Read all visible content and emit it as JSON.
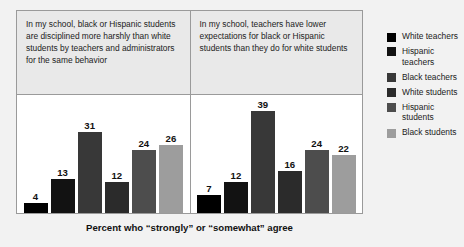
{
  "chart_data": {
    "type": "bar",
    "title": "",
    "xlabel": "Percent who “strongly” or “somewhat” agree",
    "ylabel": "",
    "ylim": [
      0,
      45
    ],
    "grid": false,
    "legend_position": "right",
    "categories": [
      "White teachers",
      "Hispanic teachers",
      "Black teachers",
      "White students",
      "Hispanic students",
      "Black students"
    ],
    "panels": [
      {
        "header": "In my school, black or Hispanic students are disciplined more harshly than white students by teachers and administrators for the same behavior",
        "values": [
          4,
          13,
          31,
          12,
          24,
          26
        ]
      },
      {
        "header": "In my school, teachers have lower expectations for black or Hispanic students than they do for white students",
        "values": [
          7,
          12,
          39,
          16,
          24,
          22
        ]
      }
    ],
    "series_colors": [
      "#000000",
      "#121212",
      "#383838",
      "#2b2b2b",
      "#4d4d4d",
      "#9d9d9d"
    ]
  },
  "legend": {
    "items": [
      {
        "label": "White teachers",
        "color": "#000000"
      },
      {
        "label": "Hispanic teachers",
        "color": "#121212"
      },
      {
        "label": "Black teachers",
        "color": "#383838"
      },
      {
        "label": "White students",
        "color": "#2b2b2b"
      },
      {
        "label": "Hispanic students",
        "color": "#4d4d4d"
      },
      {
        "label": "Black students",
        "color": "#9d9d9d"
      }
    ]
  },
  "footer": {
    "note": "Percent who “strongly” or “somewhat” agree"
  },
  "style": {
    "page_background": "#f2f2f2",
    "panel_header_background": "#e9e9e9",
    "plot_background": "#ffffff",
    "border_color": "#9a9a9a"
  }
}
